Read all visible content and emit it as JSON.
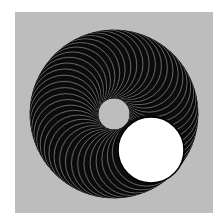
{
  "figure": {
    "canvas": {
      "width": 222,
      "height": 216,
      "page_color": "#ffffff"
    },
    "panel": {
      "x": 15,
      "y": 12,
      "width": 198,
      "height": 201,
      "color": "#bdbdbd"
    },
    "orbit": {
      "cx": 114,
      "cy": 114,
      "radius": 50
    },
    "sweep_circle": {
      "radius": 34,
      "count": 150,
      "start_angle_deg": 45,
      "sweep_deg": 355,
      "fill": "#111111",
      "stroke": "#000000",
      "highlight_stroke": "#9a9a9a"
    },
    "final_circle": {
      "cx": 151,
      "cy": 150,
      "radius": 33,
      "fill": "#ffffff",
      "stroke": "#000000"
    },
    "inner_hole": {
      "cx": 114,
      "cy": 114,
      "radius": 15,
      "color": "#bdbdbd"
    }
  }
}
